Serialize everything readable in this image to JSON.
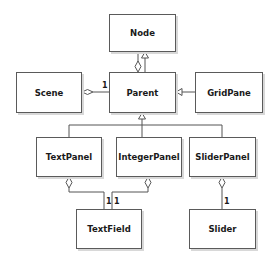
{
  "diagram": {
    "type": "uml-class-diagram",
    "classes": [
      {
        "id": "node",
        "name": "Node"
      },
      {
        "id": "parent",
        "name": "Parent"
      },
      {
        "id": "scene",
        "name": "Scene"
      },
      {
        "id": "gridpane",
        "name": "GridPane"
      },
      {
        "id": "textpanel",
        "name": "TextPanel"
      },
      {
        "id": "integerpanel",
        "name": "IntegerPanel"
      },
      {
        "id": "sliderpanel",
        "name": "SliderPanel"
      },
      {
        "id": "textfield",
        "name": "TextField"
      },
      {
        "id": "slider",
        "name": "Slider"
      }
    ],
    "relations": [
      {
        "from": "parent",
        "to": "node",
        "kind": "generalization"
      },
      {
        "from": "node",
        "to": "parent",
        "kind": "aggregation",
        "multiplicity": ""
      },
      {
        "from": "parent",
        "to": "scene",
        "kind": "aggregation",
        "multiplicity": "1"
      },
      {
        "from": "gridpane",
        "to": "parent",
        "kind": "generalization"
      },
      {
        "from": "textpanel",
        "to": "parent",
        "kind": "generalization"
      },
      {
        "from": "integerpanel",
        "to": "parent",
        "kind": "generalization"
      },
      {
        "from": "sliderpanel",
        "to": "parent",
        "kind": "generalization"
      },
      {
        "from": "textfield",
        "to": "textpanel",
        "kind": "aggregation",
        "multiplicity": "1"
      },
      {
        "from": "textfield",
        "to": "integerpanel",
        "kind": "aggregation",
        "multiplicity": "1"
      },
      {
        "from": "slider",
        "to": "sliderpanel",
        "kind": "aggregation",
        "multiplicity": "1"
      }
    ],
    "labels": {
      "node": "Node",
      "parent": "Parent",
      "scene": "Scene",
      "gridpane": "GridPane",
      "textpanel": "TextPanel",
      "integerpanel": "IntegerPanel",
      "sliderpanel": "SliderPanel",
      "textfield": "TextField",
      "slider": "Slider"
    },
    "multiplicities": {
      "scene_parent": "1",
      "textfield_textpanel": "1",
      "textfield_integerpanel": "1",
      "slider_sliderpanel": "1"
    },
    "colors": {
      "box_border": "#5a5a5a",
      "box_fill": "#ffffff",
      "line": "#555555",
      "text": "#1a1a1a"
    }
  }
}
